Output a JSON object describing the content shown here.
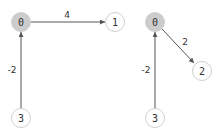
{
  "graphs": [
    {
      "nodes": [
        {
          "id": "0",
          "label": "0",
          "x": 21,
          "y": 22,
          "highlight": true
        },
        {
          "id": "1",
          "label": "1",
          "x": 115,
          "y": 22,
          "highlight": false
        },
        {
          "id": "3",
          "label": "3",
          "x": 21,
          "y": 118,
          "highlight": false
        }
      ],
      "edges": [
        {
          "from": "0",
          "to": "1",
          "weight": "4"
        },
        {
          "from": "3",
          "to": "0",
          "weight": "-2"
        }
      ]
    },
    {
      "nodes": [
        {
          "id": "0",
          "label": "0",
          "x": 155,
          "y": 22,
          "highlight": true
        },
        {
          "id": "2",
          "label": "2",
          "x": 202,
          "y": 71,
          "highlight": false
        },
        {
          "id": "3",
          "label": "3",
          "x": 155,
          "y": 118,
          "highlight": false
        }
      ],
      "edges": [
        {
          "from": "0",
          "to": "2",
          "weight": "2"
        },
        {
          "from": "3",
          "to": "0",
          "weight": "-2"
        }
      ]
    }
  ],
  "colors": {
    "highlight_fill": "#cccccc",
    "node_fill": "#ffffff",
    "node_stroke": "#cfcfcf",
    "edge": "#555555"
  }
}
